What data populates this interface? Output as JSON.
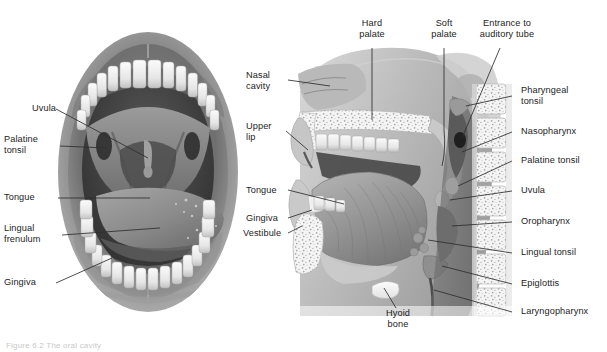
{
  "figure": {
    "caption": "Figure 6.2  The oral cavity",
    "panels": [
      {
        "id": "a",
        "name": "anterior-view-oral-cavity"
      },
      {
        "id": "b",
        "name": "sagittal-section-head-neck"
      }
    ]
  },
  "colors": {
    "ink": "#1c1c1c",
    "leader": "#3a3a3a",
    "tissue_mid": "#8d8d8d",
    "tissue_dark": "#4a4a4a",
    "tissue_light": "#d8d8d8",
    "tooth": "#f2f2f2",
    "bone": "#efefef",
    "cavity": "#3f3f3f"
  },
  "left_panel_labels": [
    {
      "text": "Uvula",
      "name": "label-uvula-left"
    },
    {
      "text": "Palatine\ntonsil",
      "name": "label-palatine-tonsil-left"
    },
    {
      "text": "Tongue",
      "name": "label-tongue-left"
    },
    {
      "text": "Lingual\nfrenulum",
      "name": "label-lingual-frenulum-left"
    },
    {
      "text": "Gingiva",
      "name": "label-gingiva-left"
    }
  ],
  "middle_labels": [
    {
      "text": "Nasal\ncavity",
      "name": "label-nasal-cavity"
    },
    {
      "text": "Upper\nlip",
      "name": "label-upper-lip"
    },
    {
      "text": "Tongue",
      "name": "label-tongue-right"
    },
    {
      "text": "Gingiva",
      "name": "label-gingiva-right"
    },
    {
      "text": "Vestibule",
      "name": "label-vestibule"
    }
  ],
  "top_labels": [
    {
      "text": "Hard\npalate",
      "name": "label-hard-palate"
    },
    {
      "text": "Soft\npalate",
      "name": "label-soft-palate"
    },
    {
      "text": "Entrance to\nauditory tube",
      "name": "label-entrance-auditory-tube"
    }
  ],
  "right_labels": [
    {
      "text": "Pharyngeal\ntonsil",
      "name": "label-pharyngeal-tonsil"
    },
    {
      "text": "Nasopharynx",
      "name": "label-nasopharynx"
    },
    {
      "text": "Palatine tonsil",
      "name": "label-palatine-tonsil-right"
    },
    {
      "text": "Uvula",
      "name": "label-uvula-right"
    },
    {
      "text": "Oropharynx",
      "name": "label-oropharynx"
    },
    {
      "text": "Lingual tonsil",
      "name": "label-lingual-tonsil"
    },
    {
      "text": "Epiglottis",
      "name": "label-epiglottis"
    },
    {
      "text": "Laryngopharynx",
      "name": "label-laryngopharynx"
    }
  ],
  "bottom_labels": [
    {
      "text": "Hyoid\nbone",
      "name": "label-hyoid-bone"
    }
  ]
}
